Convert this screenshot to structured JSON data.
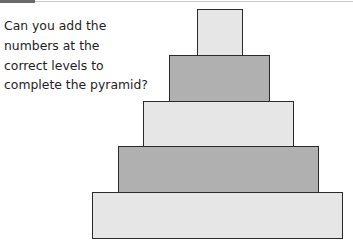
{
  "question": {
    "lines": [
      "Can you add the",
      "numbers at the",
      "correct levels to",
      "complete the pyramid?"
    ]
  },
  "pyramid": {
    "levels": [
      {
        "name": "level-1-top",
        "left": 197,
        "top": 9,
        "width": 46,
        "height": 48,
        "fill": "#e6e6e6",
        "value": ""
      },
      {
        "name": "level-2",
        "left": 169,
        "top": 55,
        "width": 101,
        "height": 48,
        "fill": "#b0b0b0",
        "value": ""
      },
      {
        "name": "level-3",
        "left": 143,
        "top": 101,
        "width": 151,
        "height": 47,
        "fill": "#e6e6e6",
        "value": ""
      },
      {
        "name": "level-4",
        "left": 118,
        "top": 146,
        "width": 201,
        "height": 47,
        "fill": "#b0b0b0",
        "value": ""
      },
      {
        "name": "level-5-base",
        "left": 92,
        "top": 192,
        "width": 251,
        "height": 47,
        "fill": "#e6e6e6",
        "value": ""
      }
    ]
  },
  "colors": {
    "accent_rule": "#6b6b6b",
    "rule": "#c8c8c8",
    "light_fill": "#e6e6e6",
    "dark_fill": "#b0b0b0",
    "border": "#2a2a2a"
  }
}
